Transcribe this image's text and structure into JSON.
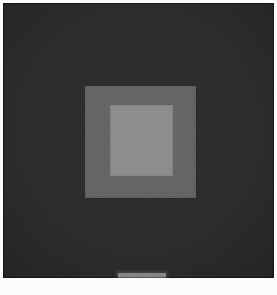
{
  "image": {
    "kind": "photograph-of-painting",
    "subject_title": "Homage to the Square",
    "composition": "three nested squares, inner squares offset toward the upper edge",
    "width_px": 277,
    "height_px": 295,
    "orientation": "portrait"
  },
  "plate": {
    "name": "artwork-plate",
    "left_px": 3,
    "top_px": 3,
    "width_px": 271,
    "height_px": 275
  },
  "fields": [
    {
      "name": "outer-field",
      "order": 1,
      "color": "#2d2d2d",
      "tone": "very dark grey",
      "left_px": 0,
      "top_px": 0,
      "width_px": 271,
      "height_px": 275
    },
    {
      "name": "middle-field",
      "order": 2,
      "color": "#666666",
      "tone": "medium grey",
      "left_px": 82,
      "top_px": 83,
      "width_px": 111,
      "height_px": 112
    },
    {
      "name": "inner-field",
      "order": 3,
      "color": "#8e8e8e",
      "tone": "light grey",
      "left_px": 107,
      "top_px": 102,
      "width_px": 63,
      "height_px": 71
    }
  ],
  "label_strip": {
    "name": "label-strip",
    "color": "#d2d0cc",
    "left_px": 115,
    "top_px": 270,
    "width_px": 48,
    "height_px": 5
  },
  "page": {
    "background": "#fbfbf9",
    "margin_px": 3,
    "bottom_margin_px": 17
  },
  "caption": {
    "text": ""
  }
}
